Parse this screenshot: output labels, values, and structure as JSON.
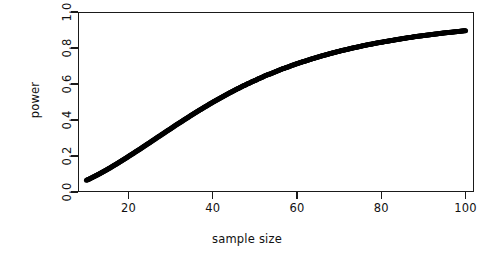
{
  "chart_data": {
    "type": "scatter",
    "title": "",
    "xlabel": "sample size",
    "ylabel": "power",
    "xlim": [
      8,
      102
    ],
    "ylim": [
      0.0,
      1.0
    ],
    "grid": false,
    "legend": null,
    "marker": {
      "shape": "circle",
      "filled": true,
      "color": "#000000",
      "size_px": 5
    },
    "frame": {
      "box": true,
      "tick_direction": "out",
      "axis_color": "#1a1a1a"
    },
    "xticks": [
      20,
      40,
      60,
      80,
      100
    ],
    "xticklabels": [
      "20",
      "40",
      "60",
      "80",
      "100"
    ],
    "yticks": [
      0.0,
      0.2,
      0.4,
      0.6,
      0.8,
      1.0
    ],
    "yticklabels": [
      "0.0",
      "0.2",
      "0.4",
      "0.6",
      "0.8",
      "1.0"
    ],
    "series": [
      {
        "name": "power",
        "x": [
          10,
          11,
          12,
          13,
          14,
          15,
          16,
          17,
          18,
          19,
          20,
          21,
          22,
          23,
          24,
          25,
          26,
          27,
          28,
          29,
          30,
          31,
          32,
          33,
          34,
          35,
          36,
          37,
          38,
          39,
          40,
          41,
          42,
          43,
          44,
          45,
          46,
          47,
          48,
          49,
          50,
          51,
          52,
          53,
          54,
          55,
          56,
          57,
          58,
          59,
          60,
          61,
          62,
          63,
          64,
          65,
          66,
          67,
          68,
          69,
          70,
          71,
          72,
          73,
          74,
          75,
          76,
          77,
          78,
          79,
          80,
          81,
          82,
          83,
          84,
          85,
          86,
          87,
          88,
          89,
          90,
          91,
          92,
          93,
          94,
          95,
          96,
          97,
          98,
          99,
          100
        ],
        "y": [
          0.065,
          0.076,
          0.088,
          0.1,
          0.113,
          0.126,
          0.14,
          0.154,
          0.168,
          0.183,
          0.198,
          0.213,
          0.228,
          0.243,
          0.259,
          0.274,
          0.29,
          0.306,
          0.321,
          0.337,
          0.352,
          0.368,
          0.383,
          0.398,
          0.413,
          0.428,
          0.443,
          0.457,
          0.471,
          0.485,
          0.499,
          0.512,
          0.525,
          0.538,
          0.551,
          0.563,
          0.575,
          0.587,
          0.598,
          0.609,
          0.62,
          0.63,
          0.641,
          0.651,
          0.66,
          0.67,
          0.679,
          0.688,
          0.696,
          0.705,
          0.713,
          0.721,
          0.728,
          0.736,
          0.743,
          0.75,
          0.757,
          0.763,
          0.77,
          0.776,
          0.782,
          0.788,
          0.793,
          0.799,
          0.804,
          0.809,
          0.814,
          0.819,
          0.823,
          0.828,
          0.832,
          0.836,
          0.84,
          0.844,
          0.848,
          0.852,
          0.856,
          0.859,
          0.863,
          0.866,
          0.869,
          0.872,
          0.875,
          0.878,
          0.881,
          0.884,
          0.886,
          0.889,
          0.891,
          0.894,
          0.896
        ]
      }
    ]
  }
}
